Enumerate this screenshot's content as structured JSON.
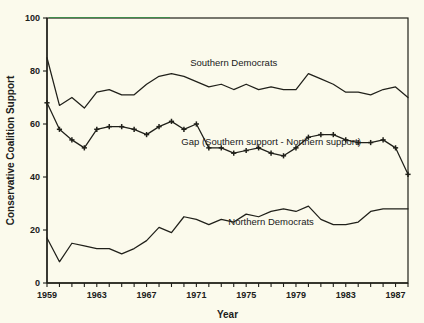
{
  "chart_data": {
    "type": "line",
    "title": "",
    "xlabel": "Year",
    "ylabel": "Conservative Coalition Support",
    "xlim": [
      1959,
      1988
    ],
    "ylim": [
      0,
      100
    ],
    "ytick_values": [
      0,
      20,
      40,
      60,
      80,
      100
    ],
    "ytick_labels": [
      "0",
      "20",
      "40",
      "60",
      "80",
      "100"
    ],
    "xtick_values": [
      1959,
      1960,
      1961,
      1962,
      1963,
      1964,
      1965,
      1966,
      1967,
      1968,
      1969,
      1970,
      1971,
      1972,
      1973,
      1974,
      1975,
      1976,
      1977,
      1978,
      1979,
      1980,
      1981,
      1982,
      1983,
      1984,
      1985,
      1986,
      1987,
      1988
    ],
    "xtick_labels": [
      "1959",
      "",
      "",
      "",
      "1963",
      "",
      "",
      "",
      "1967",
      "",
      "",
      "",
      "1971",
      "",
      "",
      "",
      "1975",
      "",
      "",
      "",
      "1979",
      "",
      "",
      "",
      "1983",
      "",
      "",
      "",
      "1987",
      ""
    ],
    "grid": false,
    "legend_position": "inline-annotations",
    "x": [
      1959,
      1960,
      1961,
      1962,
      1963,
      1964,
      1965,
      1966,
      1967,
      1968,
      1969,
      1970,
      1971,
      1972,
      1973,
      1974,
      1975,
      1976,
      1977,
      1978,
      1979,
      1980,
      1981,
      1982,
      1983,
      1984,
      1985,
      1986,
      1987,
      1988
    ],
    "series": [
      {
        "name": "Southern Democrats",
        "marker": "none",
        "label_x": 1974,
        "label_y": 82,
        "values": [
          85,
          67,
          70,
          66,
          72,
          73,
          71,
          71,
          75,
          78,
          79,
          78,
          76,
          74,
          75,
          73,
          75,
          73,
          74,
          73,
          73,
          79,
          77,
          75,
          72,
          72,
          71,
          73,
          74,
          70
        ]
      },
      {
        "name": "Gap (Southern support - Northern support)",
        "marker": "plus",
        "label_x": 1977,
        "label_y": 52,
        "values": [
          68,
          58,
          54,
          51,
          58,
          59,
          59,
          58,
          56,
          59,
          61,
          58,
          60,
          51,
          51,
          49,
          50,
          51,
          49,
          48,
          51,
          55,
          56,
          56,
          54,
          53,
          53,
          54,
          51,
          41
        ]
      },
      {
        "name": "Northern Democrats",
        "marker": "none",
        "label_x": 1977,
        "label_y": 22,
        "values": [
          17,
          8,
          15,
          14,
          13,
          13,
          11,
          13,
          16,
          21,
          19,
          25,
          24,
          22,
          24,
          23,
          26,
          25,
          27,
          28,
          27,
          29,
          24,
          22,
          22,
          23,
          27,
          28,
          28,
          28
        ]
      }
    ]
  },
  "figure": {
    "background_color": "#fbfaec",
    "ink_color": "#20201a"
  }
}
